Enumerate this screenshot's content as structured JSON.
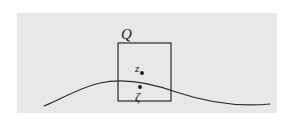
{
  "figure": {
    "name": "domain-boundary-with-square-q",
    "canvas": {
      "width": 291,
      "height": 139,
      "background_color": "#ffffff"
    },
    "shaded_region": {
      "name": "shaded-domain",
      "fill_color": "#e8e8e8",
      "x": 17,
      "y": 13,
      "width": 260,
      "height": 100
    },
    "boundary_curve": {
      "name": "boundary-curve",
      "stroke_color": "#2b2b2b",
      "stroke_width": 1.2,
      "path": "M 44,106 C 60,100 78,88 100,83 C 122,78 148,82 176,92 C 206,102 240,107 270,104"
    },
    "square": {
      "name": "square-q",
      "stroke_color": "#2b2b2b",
      "stroke_width": 1.2,
      "x": 118,
      "y": 43,
      "width": 53,
      "height": 58
    },
    "points": [
      {
        "name": "point-z",
        "cx": 142,
        "cy": 73,
        "r": 1.9,
        "color": "#1a1a1a"
      },
      {
        "name": "point-zeta",
        "cx": 140,
        "cy": 87,
        "r": 1.9,
        "color": "#1a1a1a"
      }
    ]
  },
  "labels": {
    "square_label": "Q",
    "interior_point_label": "z",
    "boundary_point_label": "ζ"
  }
}
